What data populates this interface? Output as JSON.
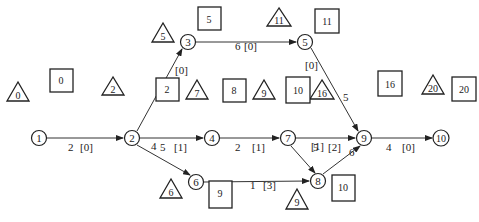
{
  "diagram": {
    "type": "activity-on-arrow network",
    "nodes": [
      {
        "id": "1",
        "label": "1",
        "x": 39,
        "y": 138
      },
      {
        "id": "2",
        "label": "2",
        "x": 132,
        "y": 138
      },
      {
        "id": "3",
        "label": "3",
        "x": 188,
        "y": 42
      },
      {
        "id": "4",
        "label": "4",
        "x": 212,
        "y": 138
      },
      {
        "id": "5",
        "label": "5",
        "x": 305,
        "y": 42
      },
      {
        "id": "6",
        "label": "6",
        "x": 196,
        "y": 182
      },
      {
        "id": "7",
        "label": "7",
        "x": 288,
        "y": 138
      },
      {
        "id": "8",
        "label": "8",
        "x": 318,
        "y": 181
      },
      {
        "id": "9",
        "label": "9",
        "x": 364,
        "y": 138
      },
      {
        "id": "10",
        "label": "10",
        "x": 442,
        "y": 138
      }
    ],
    "edges": [
      {
        "from": "1",
        "to": "2",
        "duration": "2",
        "float": "[0]"
      },
      {
        "from": "2",
        "to": "3",
        "duration": "3",
        "float": "[0]"
      },
      {
        "from": "2",
        "to": "4",
        "duration": "5",
        "float": "[1]"
      },
      {
        "from": "2",
        "to": "6",
        "duration": "4",
        "float": "[3]"
      },
      {
        "from": "3",
        "to": "5",
        "duration": "6",
        "float": "[0]"
      },
      {
        "from": "4",
        "to": "7",
        "duration": "2",
        "float": "[1]"
      },
      {
        "from": "5",
        "to": "9",
        "duration": "5",
        "float": "[0]"
      },
      {
        "from": "7",
        "to": "9",
        "duration": "5",
        "float": "[2]"
      },
      {
        "from": "7",
        "to": "8",
        "duration": "",
        "float": "[1]"
      },
      {
        "from": "6",
        "to": "8",
        "duration": "1",
        "float": "[3]"
      },
      {
        "from": "8",
        "to": "9",
        "duration": "6",
        "float": ""
      },
      {
        "from": "9",
        "to": "10",
        "duration": "4",
        "float": "[0]"
      }
    ],
    "earliest_times_triangles": [
      {
        "node": "1",
        "value": "0"
      },
      {
        "node": "2",
        "value": "2"
      },
      {
        "node": "3",
        "value": "5"
      },
      {
        "node": "4",
        "value": "7"
      },
      {
        "node": "5",
        "value": "11"
      },
      {
        "node": "6",
        "value": "6"
      },
      {
        "node": "7",
        "value": "9"
      },
      {
        "node": "8",
        "value": "9"
      },
      {
        "node": "9",
        "value": "16"
      },
      {
        "node": "10",
        "value": "20"
      }
    ],
    "latest_times_boxes": [
      {
        "node": "1",
        "value": "0"
      },
      {
        "node": "2",
        "value": "2"
      },
      {
        "node": "3",
        "value": "5"
      },
      {
        "node": "4",
        "value": "8"
      },
      {
        "node": "5",
        "value": "11"
      },
      {
        "node": "6",
        "value": "9"
      },
      {
        "node": "7",
        "value": "10"
      },
      {
        "node": "8",
        "value": "10"
      },
      {
        "node": "9",
        "value": "16"
      },
      {
        "node": "10",
        "value": "20"
      }
    ]
  },
  "labels": {
    "n1": "1",
    "n2": "2",
    "n3": "3",
    "n4": "4",
    "n5": "5",
    "n6": "6",
    "n7": "7",
    "n8": "8",
    "n9": "9",
    "n10": "10",
    "e12_d": "2",
    "e12_f": "[0]",
    "e23_d": "3",
    "e23_f": "[0]",
    "e24_d": "5",
    "e24_f": "[1]",
    "e26_d": "4",
    "e26_f": "[3]",
    "e35_d": "6",
    "e35_f": "[0]",
    "e47_d": "2",
    "e47_f": "[1]",
    "e59_d": "5",
    "e59_f": "[0]",
    "e79_d": "5",
    "e79_f": "[2]",
    "e78_f": "[1]",
    "e68_d": "1",
    "e68_f": "[3]",
    "e89_d": "6",
    "e910_d": "4",
    "e910_f": "[0]",
    "t1": "0",
    "t2": "2",
    "t3": "5",
    "t4": "7",
    "t5": "11",
    "t6": "6",
    "t7": "9",
    "t8": "9",
    "t9": "16",
    "t10": "20",
    "b1": "0",
    "b2": "2",
    "b3": "5",
    "b4": "8",
    "b5": "11",
    "b6": "9",
    "b7": "10",
    "b8": "10",
    "b9": "16",
    "b10": "20"
  }
}
